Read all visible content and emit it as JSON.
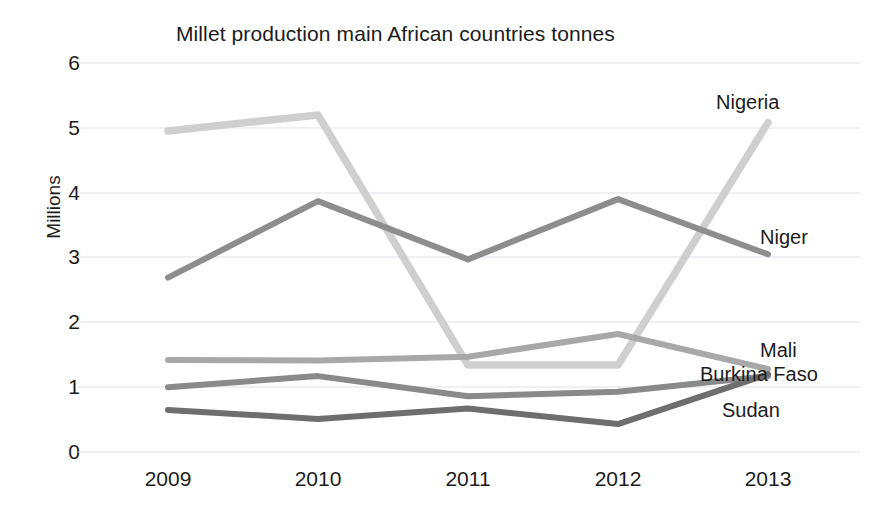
{
  "chart_data": {
    "type": "line",
    "title": "Millet production main African countries tonnes",
    "xlabel": "",
    "ylabel": "Millions",
    "categories": [
      "2009",
      "2010",
      "2011",
      "2012",
      "2013"
    ],
    "x_tick_labels": [
      "2009",
      "2010",
      "2011",
      "2012",
      "2013"
    ],
    "y_tick_labels": [
      "0",
      "1",
      "2",
      "3",
      "4",
      "5",
      "6"
    ],
    "ylim": [
      0,
      6
    ],
    "y_tick_step": 1,
    "grid": "horizontal",
    "legend_position": "right-inline-labels",
    "series": [
      {
        "name": "Nigeria",
        "values": [
          4.95,
          5.2,
          1.34,
          1.34,
          5.08
        ],
        "color": "#cfcfcf"
      },
      {
        "name": "Niger",
        "values": [
          2.69,
          3.87,
          2.97,
          3.9,
          3.05
        ],
        "color": "#8d8d8d"
      },
      {
        "name": "Mali",
        "values": [
          1.42,
          1.41,
          1.47,
          1.82,
          1.28
        ],
        "color": "#a8a8a8"
      },
      {
        "name": "Burkina Faso",
        "values": [
          1.0,
          1.17,
          0.86,
          0.93,
          1.17
        ],
        "color": "#8a8a8a"
      },
      {
        "name": "Sudan",
        "values": [
          0.65,
          0.51,
          0.67,
          0.43,
          1.2
        ],
        "color": "#6e6e6e"
      }
    ]
  },
  "series_labels": {
    "nigeria": "Nigeria",
    "niger": "Niger",
    "mali": "Mali",
    "burkina_faso": "Burkina Faso",
    "sudan": "Sudan"
  },
  "y_ticks": {
    "t0": "0",
    "t1": "1",
    "t2": "2",
    "t3": "3",
    "t4": "4",
    "t5": "5",
    "t6": "6"
  },
  "x_ticks": {
    "t0": "2009",
    "t1": "2010",
    "t2": "2011",
    "t3": "2012",
    "t4": "2013"
  },
  "axis": {
    "y_title": "Millions"
  },
  "title": {
    "text": "Millet production main African countries tonnes"
  }
}
